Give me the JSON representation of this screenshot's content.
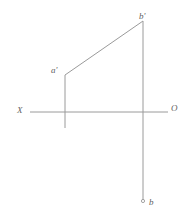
{
  "figure": {
    "type": "descriptive-geometry-projection",
    "line_color": "#9a9a9a",
    "label_color": "#5f5f5f",
    "background_color": "#ffffff",
    "width": 191,
    "height": 221
  },
  "labels": {
    "b_prime": "b'",
    "a_prime": "a'",
    "x_axis": "X",
    "origin": "O",
    "b": "b"
  },
  "geometry": {
    "axis": {
      "name": "X-O ground line",
      "x1": 30,
      "y1": 112,
      "x2": 168,
      "y2": 112
    },
    "frontal_line": {
      "name": "a'b' frontal projection",
      "x1": 65,
      "y1": 75,
      "x2": 143,
      "y2": 21
    },
    "projector_left": {
      "name": "a' vertical projector",
      "x1": 65,
      "y1": 75,
      "x2": 65,
      "y2": 128
    },
    "projector_right": {
      "name": "b-b' vertical projector",
      "x1": 143,
      "y1": 21,
      "x2": 143,
      "y2": 200
    },
    "point_b": {
      "name": "b horizontal projection point",
      "cx": 143,
      "cy": 201,
      "r": 1.6
    }
  }
}
